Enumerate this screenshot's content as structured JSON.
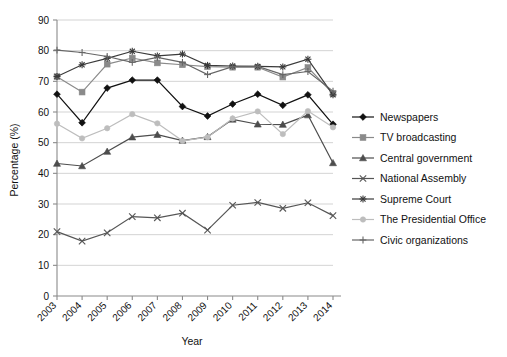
{
  "chart_data": {
    "type": "line",
    "title": "",
    "xlabel": "Year",
    "ylabel": "Percentage (%)",
    "categories": [
      "2003",
      "2004",
      "2005",
      "2006",
      "2007",
      "2008",
      "2009",
      "2010",
      "2011",
      "2012",
      "2013",
      "2014"
    ],
    "x": [
      2003,
      2004,
      2005,
      2006,
      2007,
      2008,
      2009,
      2010,
      2011,
      2012,
      2013,
      2014
    ],
    "ylim": [
      0,
      90
    ],
    "yticks": [
      0,
      10,
      20,
      30,
      40,
      50,
      60,
      70,
      80,
      90
    ],
    "grid": true,
    "legend_position": "right",
    "series": [
      {
        "name": "Newspapers",
        "marker": "diamond",
        "color": "#111111",
        "values": [
          65.8,
          56.5,
          67.8,
          70.4,
          70.4,
          61.8,
          58.7,
          62.6,
          65.8,
          62.2,
          65.6,
          56.0
        ]
      },
      {
        "name": "TV broadcasting",
        "marker": "square",
        "color": "#8a8a8a",
        "values": [
          71.5,
          66.5,
          75.6,
          77.6,
          76.0,
          75.4,
          74.8,
          74.6,
          74.6,
          71.4,
          74.5,
          66.0
        ]
      },
      {
        "name": "Central government",
        "marker": "triangle",
        "color": "#4d4d4d",
        "values": [
          43.2,
          42.4,
          47.1,
          51.8,
          52.6,
          50.7,
          51.9,
          57.6,
          56.0,
          55.9,
          59.0,
          43.4
        ]
      },
      {
        "name": "National Assembly",
        "marker": "x",
        "color": "#555555",
        "values": [
          21.0,
          17.9,
          20.6,
          25.9,
          25.5,
          27.0,
          21.5,
          29.6,
          30.5,
          28.6,
          30.4,
          26.2
        ]
      },
      {
        "name": "Supreme Court",
        "marker": "asterisk",
        "color": "#3a3a3a",
        "values": [
          71.6,
          75.4,
          77.5,
          79.8,
          78.3,
          78.9,
          75.2,
          75.0,
          74.9,
          74.7,
          77.2,
          65.6
        ]
      },
      {
        "name": "The Presidential Office",
        "marker": "circle",
        "color": "#bdbdbd",
        "values": [
          56.2,
          51.4,
          54.7,
          59.3,
          56.3,
          50.6,
          51.8,
          57.9,
          60.2,
          52.8,
          60.3,
          55.0
        ]
      },
      {
        "name": "Civic organizations",
        "marker": "plus",
        "color": "#666666",
        "values": [
          80.2,
          79.4,
          78.1,
          76.2,
          77.8,
          76.2,
          72.2,
          74.8,
          74.9,
          72.2,
          73.2,
          66.8
        ]
      }
    ]
  },
  "axes": {
    "y_title": "Percentage (%)",
    "x_title": "Year"
  }
}
